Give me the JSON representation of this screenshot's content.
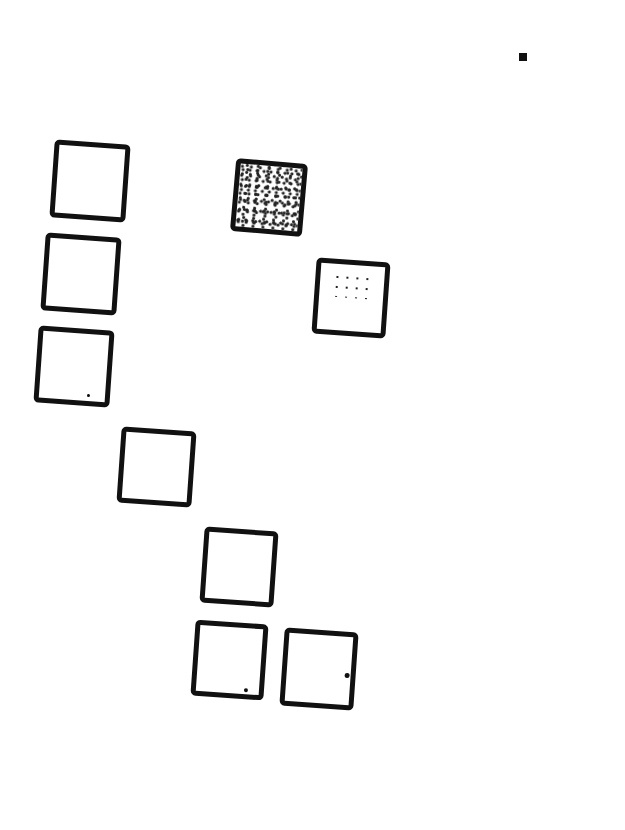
{
  "document": {
    "type": "scanned-checkbox-form",
    "marker": {
      "x": 519,
      "y": 53,
      "size": 8
    },
    "boxes": [
      {
        "id": 1,
        "x": 52,
        "y": 142,
        "w": 76,
        "h": 78,
        "state": "empty"
      },
      {
        "id": 2,
        "x": 43,
        "y": 235,
        "w": 76,
        "h": 78,
        "state": "empty"
      },
      {
        "id": 3,
        "x": 36,
        "y": 328,
        "w": 76,
        "h": 77,
        "state": "empty",
        "stray_mark": true
      },
      {
        "id": 4,
        "x": 119,
        "y": 429,
        "w": 75,
        "h": 76,
        "state": "empty"
      },
      {
        "id": 5,
        "x": 202,
        "y": 529,
        "w": 74,
        "h": 76,
        "state": "empty"
      },
      {
        "id": 6,
        "x": 193,
        "y": 622,
        "w": 73,
        "h": 76,
        "state": "empty",
        "stray_mark": true
      },
      {
        "id": 7,
        "x": 282,
        "y": 630,
        "w": 74,
        "h": 78,
        "state": "empty",
        "stray_mark": true
      },
      {
        "id": 8,
        "x": 233,
        "y": 161,
        "w": 72,
        "h": 73,
        "state": "filled-noisy"
      },
      {
        "id": 9,
        "x": 314,
        "y": 260,
        "w": 74,
        "h": 76,
        "state": "light-marks"
      }
    ]
  }
}
